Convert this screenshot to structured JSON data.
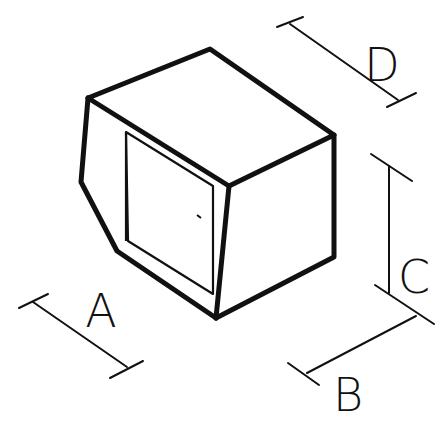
{
  "diagram": {
    "type": "isometric dimension drawing",
    "colors": {
      "line": "#111111",
      "background": "#ffffff"
    },
    "dimensions": [
      {
        "id": "A",
        "label": "A",
        "meaning": "front width (left-front edge)"
      },
      {
        "id": "B",
        "label": "B",
        "meaning": "side depth (bottom-right edge)"
      },
      {
        "id": "C",
        "label": "C",
        "meaning": "height (right vertical edge)"
      },
      {
        "id": "D",
        "label": "D",
        "meaning": "top depth (top-right edge)"
      }
    ]
  }
}
